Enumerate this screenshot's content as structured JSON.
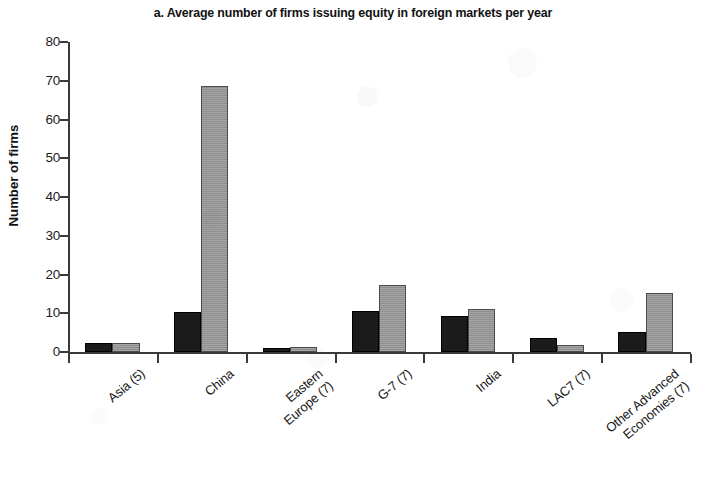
{
  "chart_data": {
    "type": "bar",
    "title": "a. Average number of firms issuing equity in foreign markets per year",
    "xlabel": "",
    "ylabel": "Number of firms",
    "ylim": [
      0,
      80
    ],
    "yticks": [
      0,
      10,
      20,
      30,
      40,
      50,
      60,
      70,
      80
    ],
    "ytick_labels": [
      "0",
      "10",
      "20",
      "30",
      "40",
      "50",
      "60",
      "70",
      "80"
    ],
    "grid": false,
    "legend": "none",
    "categories": [
      "Asia (5)",
      "China",
      "Eastern\nEurope (7)",
      "G-7 (7)",
      "India",
      "LAC7 (7)",
      "Other Advanced\nEconomies (7)"
    ],
    "series": [
      {
        "name": "series-1",
        "color": "#1b1b1b",
        "values": [
          2.3,
          10.3,
          1.0,
          10.7,
          9.2,
          3.5,
          5.2
        ]
      },
      {
        "name": "series-2",
        "color": "#9b9b9b",
        "values": [
          2.2,
          68.6,
          1.4,
          17.4,
          11.1,
          1.8,
          15.3
        ]
      }
    ]
  },
  "colors": {
    "axis": "#3a3a3a",
    "text": "#111111",
    "background": "#ffffff",
    "series_dark": "#1b1b1b",
    "series_light": "#9b9b9b"
  }
}
